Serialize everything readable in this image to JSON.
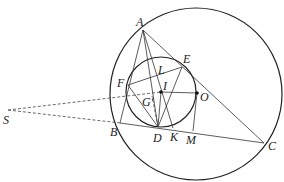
{
  "diagram": {
    "type": "geometry",
    "points": {
      "A": {
        "label": "A",
        "x": 143,
        "y": 30
      },
      "B": {
        "label": "B",
        "x": 120,
        "y": 123
      },
      "C": {
        "label": "C",
        "x": 264,
        "y": 143
      },
      "D": {
        "label": "D",
        "x": 158,
        "y": 127
      },
      "E": {
        "label": "E",
        "x": 182,
        "y": 67
      },
      "F": {
        "label": "F",
        "x": 128,
        "y": 85
      },
      "G": {
        "label": "G'",
        "x": 152,
        "y": 96
      },
      "I": {
        "label": "I",
        "x": 161,
        "y": 92
      },
      "K": {
        "label": "K",
        "x": 173,
        "y": 128
      },
      "L": {
        "label": "L",
        "x": 158,
        "y": 71
      },
      "M": {
        "label": "M",
        "x": 193,
        "y": 131
      },
      "O": {
        "label": "O",
        "x": 197,
        "y": 93
      },
      "S": {
        "label": "S",
        "x": 8,
        "y": 110
      }
    },
    "circles": [
      {
        "name": "circumcircle",
        "cx": 196,
        "cy": 94,
        "r": 86
      },
      {
        "name": "incircle",
        "cx": 161,
        "cy": 92,
        "r": 35
      }
    ]
  }
}
